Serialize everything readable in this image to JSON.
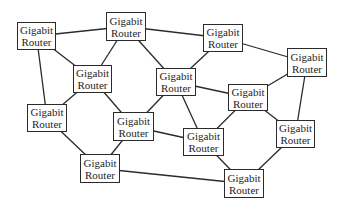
{
  "diagram": {
    "type": "network",
    "line_color": "#2b2b2b",
    "nodes": [
      {
        "id": "n1",
        "line1": "Gigabit",
        "line2": "Router",
        "x": 17,
        "y": 22,
        "w": 39,
        "h": 28
      },
      {
        "id": "n2",
        "line1": "Gigabit",
        "line2": "Router",
        "x": 106,
        "y": 12,
        "w": 40,
        "h": 29
      },
      {
        "id": "n3",
        "line1": "Gigabit",
        "line2": "Router",
        "x": 203,
        "y": 24,
        "w": 40,
        "h": 28
      },
      {
        "id": "n4",
        "line1": "Gigabit",
        "line2": "Router",
        "x": 287,
        "y": 48,
        "w": 40,
        "h": 29
      },
      {
        "id": "n5",
        "line1": "Gigabit",
        "line2": "Router",
        "x": 73,
        "y": 65,
        "w": 39,
        "h": 28
      },
      {
        "id": "n6",
        "line1": "Gigabit",
        "line2": "Router",
        "x": 156,
        "y": 68,
        "w": 40,
        "h": 28
      },
      {
        "id": "n7",
        "line1": "Gigabit",
        "line2": "Router",
        "x": 228,
        "y": 84,
        "w": 40,
        "h": 27
      },
      {
        "id": "n8",
        "line1": "Gigabit",
        "line2": "Router",
        "x": 27,
        "y": 104,
        "w": 40,
        "h": 28
      },
      {
        "id": "n9",
        "line1": "Gigabit",
        "line2": "Router",
        "x": 113,
        "y": 112,
        "w": 41,
        "h": 29
      },
      {
        "id": "n10",
        "line1": "Gigabit",
        "line2": "Router",
        "x": 183,
        "y": 128,
        "w": 41,
        "h": 28
      },
      {
        "id": "n11",
        "line1": "Gigabit",
        "line2": "Router",
        "x": 276,
        "y": 120,
        "w": 39,
        "h": 28
      },
      {
        "id": "n12",
        "line1": "Gigabit",
        "line2": "Router",
        "x": 80,
        "y": 154,
        "w": 40,
        "h": 29
      },
      {
        "id": "n13",
        "line1": "Gigabit",
        "line2": "Router",
        "x": 224,
        "y": 169,
        "w": 40,
        "h": 29
      }
    ],
    "edges": [
      [
        "n1",
        "n2"
      ],
      [
        "n1",
        "n5"
      ],
      [
        "n1",
        "n8"
      ],
      [
        "n2",
        "n3"
      ],
      [
        "n2",
        "n5"
      ],
      [
        "n2",
        "n6"
      ],
      [
        "n3",
        "n4"
      ],
      [
        "n3",
        "n6"
      ],
      [
        "n4",
        "n7"
      ],
      [
        "n4",
        "n11"
      ],
      [
        "n5",
        "n8"
      ],
      [
        "n5",
        "n9"
      ],
      [
        "n6",
        "n7"
      ],
      [
        "n6",
        "n9"
      ],
      [
        "n6",
        "n10"
      ],
      [
        "n7",
        "n10"
      ],
      [
        "n7",
        "n11"
      ],
      [
        "n8",
        "n12"
      ],
      [
        "n9",
        "n10"
      ],
      [
        "n9",
        "n12"
      ],
      [
        "n10",
        "n13"
      ],
      [
        "n11",
        "n13"
      ],
      [
        "n12",
        "n13"
      ]
    ]
  }
}
